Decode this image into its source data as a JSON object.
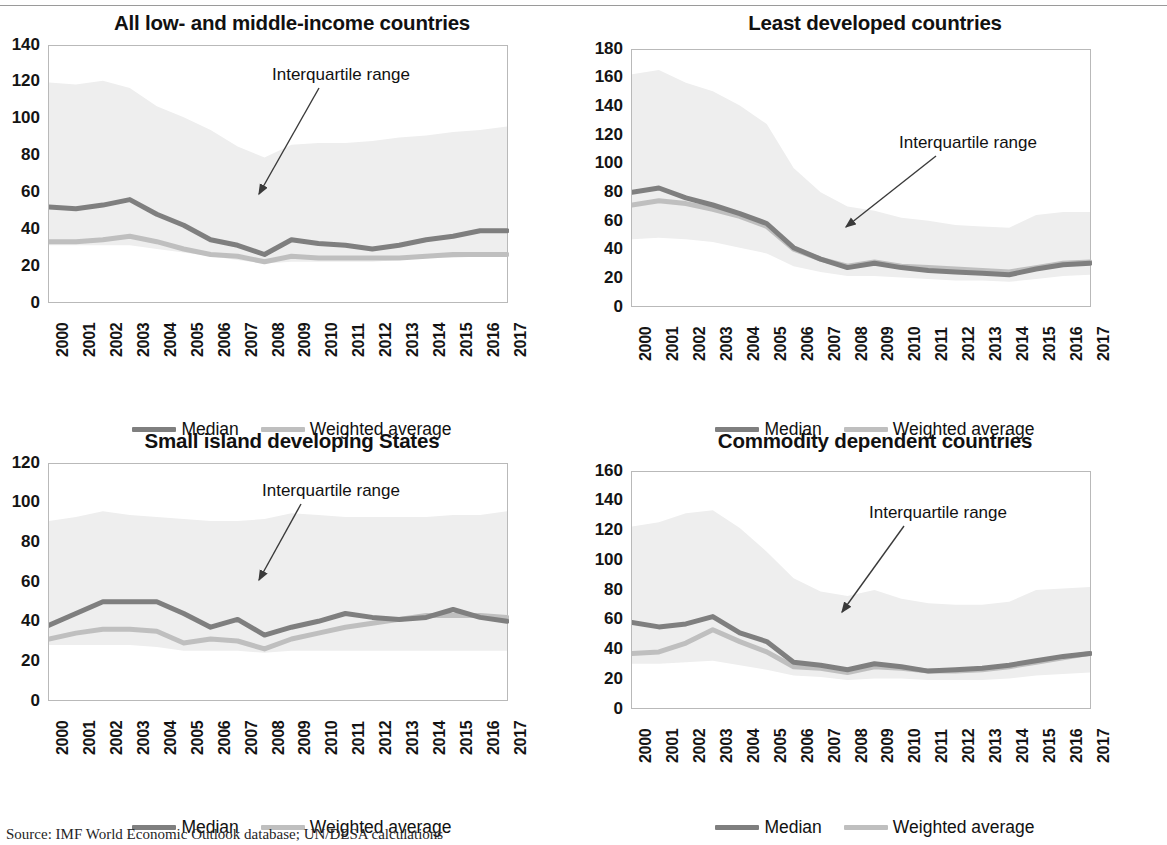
{
  "figure": {
    "source_note": "Source: IMF World Economic Outlook database; UN/DESA calculations",
    "annotation_label": "Interquartile range",
    "legend": {
      "median_label": "Median",
      "weighted_label": "Weighted average",
      "median_color": "#7f7f7f",
      "weighted_color": "#bfbfbf",
      "band_color": "#eeeeee"
    }
  },
  "chart_data": [
    {
      "type": "line",
      "title": "All low- and middle-income countries",
      "xlabel": "",
      "ylabel": "",
      "ylim": [
        0,
        140
      ],
      "yticks": [
        0,
        20,
        40,
        60,
        80,
        100,
        120,
        140
      ],
      "x": [
        "2000",
        "2001",
        "2002",
        "2003",
        "2004",
        "2005",
        "2006",
        "2007",
        "2008",
        "2009",
        "2010",
        "2011",
        "2012",
        "2013",
        "2014",
        "2015",
        "2016",
        "2017"
      ],
      "grid": false,
      "legend_position": "bottom",
      "annotations": [
        "Interquartile range"
      ],
      "series": [
        {
          "name": "Median",
          "values": [
            52,
            51,
            53,
            56,
            48,
            42,
            34,
            31,
            26,
            34,
            32,
            31,
            29,
            31,
            34,
            36,
            39,
            39
          ]
        },
        {
          "name": "Weighted average",
          "values": [
            33,
            33,
            34,
            36,
            33,
            29,
            26,
            25,
            22,
            25,
            24,
            24,
            24,
            24,
            25,
            26,
            26,
            26
          ]
        },
        {
          "name": "Interquartile range upper",
          "values": [
            120,
            119,
            121,
            117,
            107,
            101,
            94,
            85,
            79,
            86,
            87,
            87,
            88,
            90,
            91,
            93,
            94,
            96
          ]
        },
        {
          "name": "Interquartile range lower",
          "values": [
            31,
            31,
            31,
            31,
            29,
            27,
            25,
            23,
            21,
            22,
            22,
            22,
            22,
            23,
            24,
            24,
            25,
            25
          ]
        }
      ]
    },
    {
      "type": "line",
      "title": "Least developed countries",
      "xlabel": "",
      "ylabel": "",
      "ylim": [
        0,
        180
      ],
      "yticks": [
        0,
        20,
        40,
        60,
        80,
        100,
        120,
        140,
        160,
        180
      ],
      "x": [
        "2000",
        "2001",
        "2002",
        "2003",
        "2004",
        "2005",
        "2006",
        "2007",
        "2008",
        "2009",
        "2010",
        "2011",
        "2012",
        "2013",
        "2014",
        "2015",
        "2016",
        "2017"
      ],
      "grid": false,
      "legend_position": "bottom",
      "annotations": [
        "Interquartile range"
      ],
      "series": [
        {
          "name": "Median",
          "values": [
            80,
            83,
            76,
            71,
            65,
            58,
            41,
            33,
            27,
            30,
            27,
            25,
            24,
            23,
            22,
            26,
            29,
            30
          ]
        },
        {
          "name": "Weighted average",
          "values": [
            71,
            74,
            72,
            68,
            63,
            56,
            40,
            33,
            28,
            31,
            28,
            27,
            26,
            25,
            24,
            27,
            30,
            31
          ]
        },
        {
          "name": "Interquartile range upper",
          "values": [
            163,
            166,
            157,
            151,
            141,
            128,
            97,
            80,
            70,
            67,
            62,
            60,
            57,
            56,
            55,
            64,
            66,
            66
          ]
        },
        {
          "name": "Interquartile range lower",
          "values": [
            47,
            48,
            47,
            45,
            41,
            37,
            28,
            24,
            21,
            21,
            20,
            19,
            18,
            18,
            17,
            19,
            21,
            22
          ]
        }
      ]
    },
    {
      "type": "line",
      "title": "Small island developing States",
      "xlabel": "",
      "ylabel": "",
      "ylim": [
        0,
        120
      ],
      "yticks": [
        0,
        20,
        40,
        60,
        80,
        100,
        120
      ],
      "x": [
        "2000",
        "2001",
        "2002",
        "2003",
        "2004",
        "2005",
        "2006",
        "2007",
        "2008",
        "2009",
        "2010",
        "2011",
        "2012",
        "2013",
        "2014",
        "2015",
        "2016",
        "2017"
      ],
      "grid": false,
      "legend_position": "bottom",
      "annotations": [
        "Interquartile range"
      ],
      "series": [
        {
          "name": "Median",
          "values": [
            38,
            44,
            50,
            50,
            50,
            44,
            37,
            41,
            33,
            37,
            40,
            44,
            42,
            41,
            42,
            46,
            42,
            40
          ]
        },
        {
          "name": "Weighted average",
          "values": [
            31,
            34,
            36,
            36,
            35,
            29,
            31,
            30,
            26,
            31,
            34,
            37,
            39,
            41,
            43,
            43,
            43,
            42
          ]
        },
        {
          "name": "Interquartile range upper",
          "values": [
            91,
            93,
            96,
            94,
            93,
            92,
            91,
            91,
            92,
            95,
            94,
            93,
            93,
            93,
            93,
            94,
            94,
            96
          ]
        },
        {
          "name": "Interquartile range lower",
          "values": [
            28,
            28,
            28,
            28,
            27,
            25,
            25,
            25,
            24,
            25,
            25,
            25,
            25,
            25,
            25,
            25,
            25,
            25
          ]
        }
      ]
    },
    {
      "type": "line",
      "title": "Commodity dependent countries",
      "xlabel": "",
      "ylabel": "",
      "ylim": [
        0,
        160
      ],
      "yticks": [
        0,
        20,
        40,
        60,
        80,
        100,
        120,
        140,
        160
      ],
      "x": [
        "2000",
        "2001",
        "2002",
        "2003",
        "2004",
        "2005",
        "2006",
        "2007",
        "2008",
        "2009",
        "2010",
        "2011",
        "2012",
        "2013",
        "2014",
        "2015",
        "2016",
        "2017"
      ],
      "grid": false,
      "legend_position": "bottom",
      "annotations": [
        "Interquartile range"
      ],
      "series": [
        {
          "name": "Median",
          "values": [
            58,
            55,
            57,
            62,
            51,
            45,
            31,
            29,
            26,
            30,
            28,
            25,
            26,
            27,
            29,
            32,
            35,
            37
          ]
        },
        {
          "name": "Weighted average",
          "values": [
            37,
            38,
            44,
            53,
            45,
            38,
            28,
            27,
            24,
            28,
            27,
            25,
            25,
            26,
            28,
            31,
            34,
            37
          ]
        },
        {
          "name": "Interquartile range upper",
          "values": [
            123,
            126,
            132,
            134,
            122,
            106,
            88,
            79,
            76,
            80,
            74,
            71,
            70,
            70,
            72,
            80,
            81,
            82
          ]
        },
        {
          "name": "Interquartile range lower",
          "values": [
            30,
            30,
            31,
            32,
            29,
            26,
            22,
            21,
            19,
            20,
            20,
            19,
            19,
            19,
            20,
            22,
            23,
            24
          ]
        }
      ]
    }
  ]
}
